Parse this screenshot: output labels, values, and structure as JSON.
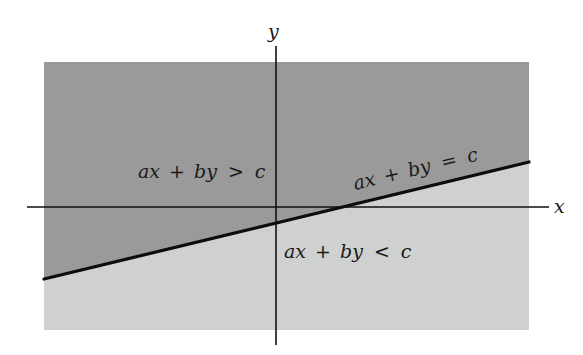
{
  "figure": {
    "type": "half-plane diagram",
    "axes": {
      "x_label": "x",
      "y_label": "y"
    },
    "boundary_line": {
      "label": "ax + by = c",
      "parts": [
        "ax",
        "+",
        "by",
        "=",
        "c"
      ]
    },
    "regions": {
      "upper": {
        "label": "ax + by > c",
        "parts": [
          "ax",
          "+",
          "by",
          ">",
          "c"
        ],
        "color": "#9a9a9a"
      },
      "lower": {
        "label": "ax + by < c",
        "parts": [
          "ax",
          "+",
          "by",
          "<",
          "c"
        ],
        "color": "#cfd0d0"
      }
    },
    "colors": {
      "axis": "#111111",
      "boundary": "#0d0d0d",
      "background": "#ffffff"
    }
  }
}
